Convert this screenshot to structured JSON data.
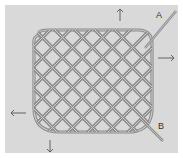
{
  "figure": {
    "labels": {
      "a": "A",
      "b": "B"
    },
    "arrows": [
      "up",
      "right",
      "left",
      "down"
    ],
    "colors": {
      "background": "#d9d9d9",
      "cord": "#8c8c8c",
      "cord_highlight": "#c8c8c8",
      "arrow": "#555555"
    }
  }
}
